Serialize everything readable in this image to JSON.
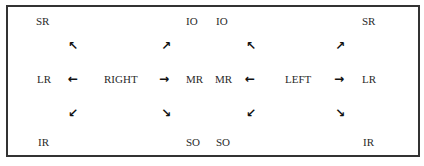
{
  "diagram": {
    "title": "",
    "panels": [
      {
        "center": "RIGHT",
        "top_left": "SR",
        "top_right": "IO",
        "mid_left": "LR",
        "mid_right": "MR",
        "bottom_left": "IR",
        "bottom_right": "SO"
      },
      {
        "center": "LEFT",
        "top_left": "IO",
        "top_right": "SR",
        "mid_left": "MR",
        "mid_right": "LR",
        "bottom_left": "SO",
        "bottom_right": "IR"
      }
    ],
    "arrows": {
      "up_left": "🡬",
      "up_right": "🡭",
      "left": "🡠",
      "right": "🡢",
      "down_left": "🡯",
      "down_right": "🡮"
    }
  }
}
